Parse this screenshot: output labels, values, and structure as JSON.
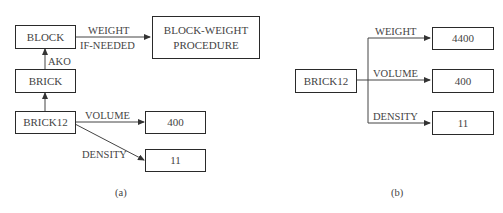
{
  "diagram_a": {
    "caption": "(a)",
    "nodes": {
      "block": "BLOCK",
      "brick": "BRICK",
      "brick12": "BRICK12",
      "procedure_line1": "BLOCK-WEIGHT",
      "procedure_line2": "PROCEDURE",
      "volume_value": "400",
      "density_value": "11"
    },
    "edges": {
      "weight": "WEIGHT",
      "if_needed": "IF-NEEDED",
      "ako": "AKO",
      "volume": "VOLUME",
      "density": "DENSITY"
    }
  },
  "diagram_b": {
    "caption": "(b)",
    "nodes": {
      "brick12": "BRICK12",
      "weight_value": "4400",
      "volume_value": "400",
      "density_value": "11"
    },
    "edges": {
      "weight": "WEIGHT",
      "volume": "VOLUME",
      "density": "DENSITY"
    }
  }
}
